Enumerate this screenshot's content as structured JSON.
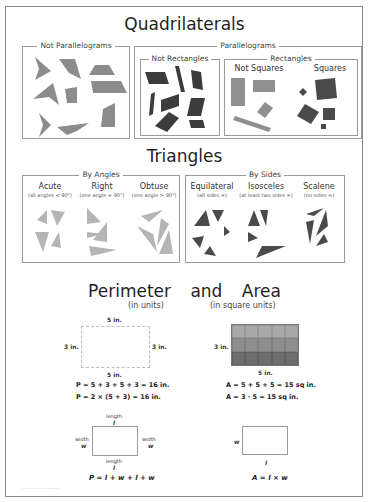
{
  "quadrilaterals": {
    "title": "Quadrilaterals",
    "not_parallelograms": {
      "label": "Not Parallelograms"
    },
    "parallelograms": {
      "label": "Parallelograms",
      "not_rectangles": {
        "label": "Not Rectangles"
      },
      "rectangles": {
        "label": "Rectangles",
        "not_squares": "Not Squares",
        "squares": "Squares"
      }
    }
  },
  "triangles": {
    "title": "Triangles",
    "by_angles": {
      "label": "By Angles",
      "types": [
        {
          "name": "Acute",
          "desc": "(all angles < 90°)"
        },
        {
          "name": "Right",
          "desc": "(one angle = 90°)"
        },
        {
          "name": "Obtuse",
          "desc": "(one angle > 90°)"
        }
      ]
    },
    "by_sides": {
      "label": "By Sides",
      "types": [
        {
          "name": "Equilateral",
          "desc": "(all sides =)"
        },
        {
          "name": "Isosceles",
          "desc": "(at least two sides =)"
        },
        {
          "name": "Scalene",
          "desc": "(no sides =)"
        }
      ]
    }
  },
  "perimeter_area": {
    "title_word1": "Perimeter",
    "title_word2": "and",
    "title_word3": "Area",
    "perimeter": {
      "units": "(in units)",
      "top": "5 in.",
      "bottom": "5 in.",
      "left": "3 in.",
      "right": "3 in.",
      "formula1": "P = 5 + 3 + 5 + 3 = 16 in.",
      "formula2": "P = 2 × (5 + 3) = 16 in.",
      "general": {
        "length_top": "length",
        "l_top": "l",
        "length_bottom": "length",
        "l_bottom": "l",
        "width_left": "width",
        "w_left": "w",
        "width_right": "width",
        "w_right": "w",
        "formula": "P = l + w + l + w"
      }
    },
    "area": {
      "units": "(in square units)",
      "side": "3 in.",
      "bottom": "5 in.",
      "formula1": "A = 5 + 5 + 5 = 15 sq in.",
      "formula2": "A = 3 · 5 = 15 sq in.",
      "grid": {
        "cols": 5,
        "rows": 3,
        "row_colors": [
          "#a9a9a9",
          "#8e8e8e",
          "#6e6e6e"
        ]
      },
      "general": {
        "w": "w",
        "l": "l",
        "formula": "A = l × w"
      }
    }
  },
  "colors": {
    "not_parallelogram_fill": "#8c8c8c",
    "not_rectangle_fill": "#3c3c3c",
    "not_square_fill": "#8f8f8f",
    "square_fill": "#4a4a4a",
    "angle_triangle_fill": "#b5b5b5",
    "side_triangle_fill": "#4a4a4a"
  }
}
